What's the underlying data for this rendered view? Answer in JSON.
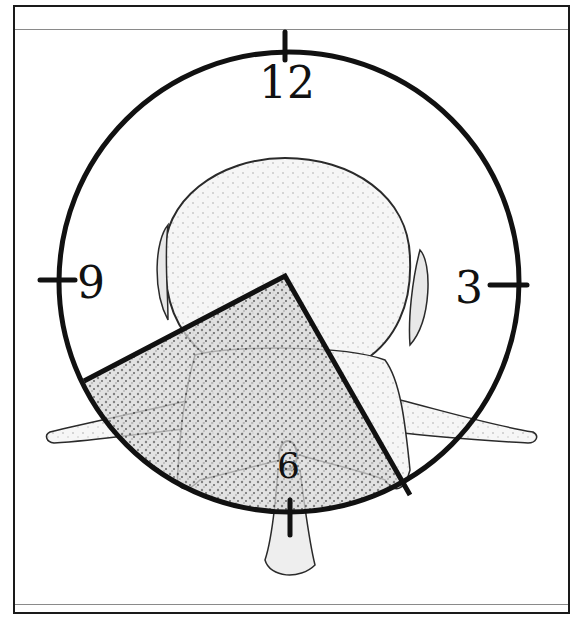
{
  "diagram": {
    "clock_labels": {
      "twelve": "12",
      "three": "3",
      "six": "6",
      "nine": "9"
    },
    "highlighted_sector": {
      "description": "Shaded wedge spanning from the vertebral body center toward the 6 to 8 o'clock region",
      "from_hour": 6,
      "to_hour": 8
    },
    "colors": {
      "line": "#111111",
      "shading": "#7a7a7a",
      "bone_outline": "#2a2a2a",
      "background": "#ffffff"
    }
  }
}
